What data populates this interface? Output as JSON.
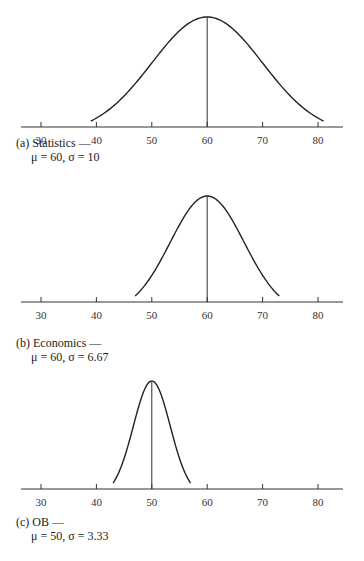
{
  "chart_data": [
    {
      "type": "line",
      "title": "(a) Statistics — μ = 60, σ = 10",
      "label": "(a)",
      "subject": "Statistics —",
      "params": "μ = 60, σ = 10",
      "mean": 60,
      "sd": 10,
      "x_ticks": [
        30,
        40,
        50,
        60,
        70,
        80
      ],
      "xlim": [
        28,
        84
      ],
      "curve_range": [
        39,
        81
      ],
      "grid": false
    },
    {
      "type": "line",
      "title": "(b) Economics — μ = 60, σ = 6.67",
      "label": "(b)",
      "subject": "Economics —",
      "params": "μ = 60, σ = 6.67",
      "mean": 60,
      "sd": 6.67,
      "x_ticks": [
        30,
        40,
        50,
        60,
        70,
        80
      ],
      "xlim": [
        28,
        84
      ],
      "curve_range": [
        47,
        73
      ],
      "grid": false
    },
    {
      "type": "line",
      "title": "(c) OB — μ = 50, σ = 3.33",
      "label": "(c)",
      "subject": "OB —",
      "params": "μ = 50, σ = 3.33",
      "mean": 50,
      "sd": 3.33,
      "x_ticks": [
        30,
        40,
        50,
        60,
        70,
        80
      ],
      "xlim": [
        28,
        84
      ],
      "curve_range": [
        43,
        57
      ],
      "grid": false
    }
  ],
  "captions": [
    {
      "l1": "(a)  Statistics —",
      "l2": "μ  =  60,  σ  =  10"
    },
    {
      "l1": "(b)  Economics —",
      "l2": "μ  =  60,  σ  =  6.67"
    },
    {
      "l1": "(c)  OB —",
      "l2": "μ  =  50,  σ  =  3.33"
    }
  ],
  "tick_labels": [
    "30",
    "40",
    "50",
    "60",
    "70",
    "80"
  ]
}
